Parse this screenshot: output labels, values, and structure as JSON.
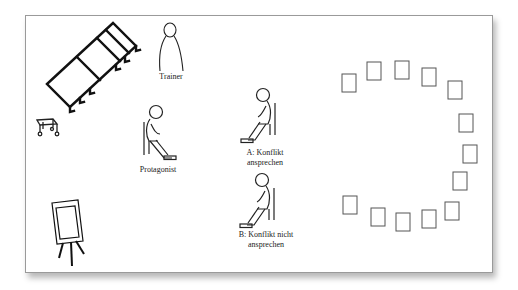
{
  "diagram": {
    "title": "",
    "labels": {
      "trainer": "Trainer",
      "protagonist": "Protagonist",
      "option_a": "A: Konflikt\nansprechen",
      "option_b": "B: Konflikt nicht\nansprechen"
    },
    "elements": [
      {
        "id": "tables",
        "type": "tilted-table-row",
        "label": ""
      },
      {
        "id": "cart",
        "type": "wheeled-cart",
        "label": ""
      },
      {
        "id": "flipchart",
        "type": "flipchart-easel",
        "label": ""
      },
      {
        "id": "trainer",
        "type": "standing-figure",
        "label": "Trainer"
      },
      {
        "id": "protagonist",
        "type": "seated-figure",
        "label": "Protagonist"
      },
      {
        "id": "option-a",
        "type": "seated-figure",
        "label": "A: Konflikt ansprechen"
      },
      {
        "id": "option-b",
        "type": "seated-figure",
        "label": "B: Konflikt nicht ansprechen"
      },
      {
        "id": "chair-circle",
        "type": "chair-semicircle",
        "count": 14
      }
    ],
    "colors": {
      "line": "#111111",
      "chair": "#555555",
      "frame": "#9a9a9a"
    }
  }
}
